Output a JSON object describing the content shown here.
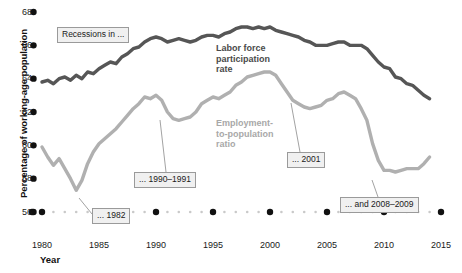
{
  "chart_data": {
    "type": "line",
    "title": "",
    "xlabel": "Year",
    "ylabel": "Percentage of working-age population",
    "xlim": [
      1980,
      2015
    ],
    "ylim": [
      56,
      68
    ],
    "grid": false,
    "legend_position": "inline-annotation",
    "xticks": [
      1980,
      1985,
      1990,
      1995,
      2000,
      2005,
      2010,
      2015
    ],
    "yticks": [
      56,
      58,
      60,
      62,
      64,
      66,
      68
    ],
    "series": [
      {
        "name": "Labor force participation rate",
        "color": "#565656",
        "x": [
          1980,
          1980.5,
          1981,
          1981.5,
          1982,
          1982.5,
          1983,
          1983.5,
          1984,
          1984.5,
          1985,
          1985.5,
          1986,
          1986.5,
          1987,
          1987.5,
          1988,
          1988.5,
          1989,
          1989.5,
          1990,
          1990.5,
          1991,
          1991.5,
          1992,
          1992.5,
          1993,
          1993.5,
          1994,
          1994.5,
          1995,
          1995.5,
          1996,
          1996.5,
          1997,
          1997.5,
          1998,
          1998.5,
          1999,
          1999.5,
          2000,
          2000.5,
          2001,
          2001.5,
          2002,
          2002.5,
          2003,
          2003.5,
          2004,
          2004.5,
          2005,
          2005.5,
          2006,
          2006.5,
          2007,
          2007.5,
          2008,
          2008.5,
          2009,
          2009.5,
          2010,
          2010.5,
          2011,
          2011.5,
          2012,
          2012.5,
          2013,
          2013.5,
          2014
        ],
        "values": [
          63.8,
          63.9,
          63.7,
          64.0,
          64.1,
          63.9,
          64.2,
          64.0,
          64.4,
          64.3,
          64.6,
          64.8,
          65.0,
          64.9,
          65.3,
          65.5,
          65.8,
          65.9,
          66.2,
          66.4,
          66.5,
          66.4,
          66.2,
          66.3,
          66.4,
          66.3,
          66.2,
          66.3,
          66.5,
          66.6,
          66.6,
          66.5,
          66.7,
          66.8,
          67.0,
          67.1,
          67.1,
          67.0,
          67.1,
          67.0,
          67.1,
          66.9,
          66.8,
          66.7,
          66.6,
          66.5,
          66.3,
          66.2,
          66.0,
          66.0,
          66.0,
          66.1,
          66.2,
          66.2,
          66.0,
          66.0,
          66.0,
          65.8,
          65.4,
          65.0,
          64.7,
          64.6,
          64.1,
          64.0,
          63.7,
          63.6,
          63.3,
          63.0,
          62.8
        ]
      },
      {
        "name": "Employment-to-population ratio",
        "color": "#b0b0b0",
        "x": [
          1980,
          1980.5,
          1981,
          1981.5,
          1982,
          1982.5,
          1983,
          1983.5,
          1984,
          1984.5,
          1985,
          1985.5,
          1986,
          1986.5,
          1987,
          1987.5,
          1988,
          1988.5,
          1989,
          1989.5,
          1990,
          1990.5,
          1991,
          1991.5,
          1992,
          1992.5,
          1993,
          1993.5,
          1994,
          1994.5,
          1995,
          1995.5,
          1996,
          1996.5,
          1997,
          1997.5,
          1998,
          1998.5,
          1999,
          1999.5,
          2000,
          2000.5,
          2001,
          2001.5,
          2002,
          2002.5,
          2003,
          2003.5,
          2004,
          2004.5,
          2005,
          2005.5,
          2006,
          2006.5,
          2007,
          2007.5,
          2008,
          2008.5,
          2009,
          2009.5,
          2010,
          2010.5,
          2011,
          2011.5,
          2012,
          2012.5,
          2013,
          2013.5,
          2014
        ],
        "values": [
          59.9,
          59.3,
          58.8,
          59.2,
          58.6,
          58.0,
          57.3,
          57.9,
          58.9,
          59.6,
          60.1,
          60.4,
          60.7,
          61.0,
          61.4,
          61.8,
          62.2,
          62.5,
          62.9,
          62.8,
          63.0,
          62.7,
          62.0,
          61.6,
          61.5,
          61.6,
          61.7,
          62.0,
          62.5,
          62.7,
          62.9,
          62.8,
          63.0,
          63.2,
          63.6,
          63.8,
          64.1,
          64.2,
          64.3,
          64.4,
          64.4,
          64.2,
          63.7,
          63.2,
          62.7,
          62.5,
          62.3,
          62.2,
          62.3,
          62.4,
          62.7,
          62.8,
          63.1,
          63.2,
          63.0,
          62.8,
          62.2,
          61.5,
          60.1,
          59.1,
          58.5,
          58.5,
          58.4,
          58.5,
          58.6,
          58.6,
          58.6,
          58.9,
          59.3
        ]
      }
    ],
    "annotations": [
      {
        "id": "recessions",
        "text": "Recessions in ..."
      },
      {
        "id": "r1982",
        "text": "... 1982"
      },
      {
        "id": "r1990",
        "text": "... 1990–1991"
      },
      {
        "id": "r2001",
        "text": "... 2001"
      },
      {
        "id": "r2008",
        "text": "... and 2008–2009"
      }
    ]
  },
  "axis": {
    "ylabel": "Percentage of working-age population",
    "xlabel": "Year",
    "yticks": [
      "68",
      "66",
      "64",
      "62",
      "60",
      "58",
      "56"
    ],
    "xticks": [
      "1980",
      "1985",
      "1990",
      "1995",
      "2000",
      "2005",
      "2010",
      "2015"
    ]
  },
  "series_labels": {
    "lfpr": "Labor force\nparticipation\nrate",
    "epop": "Employment-\nto-population\nratio"
  },
  "callouts": {
    "recessions": "Recessions in ...",
    "y1982": "... 1982",
    "y1990": "... 1990–1991",
    "y2001": "... 2001",
    "y2008": "... and 2008–2009"
  },
  "colors": {
    "lfpr": "#565656",
    "epop": "#b0b0b0",
    "tick_major": "#111111",
    "tick_minor": "#c9c9c9",
    "callout_bg": "#f0f0f0",
    "callout_border": "#9a9a9a"
  }
}
